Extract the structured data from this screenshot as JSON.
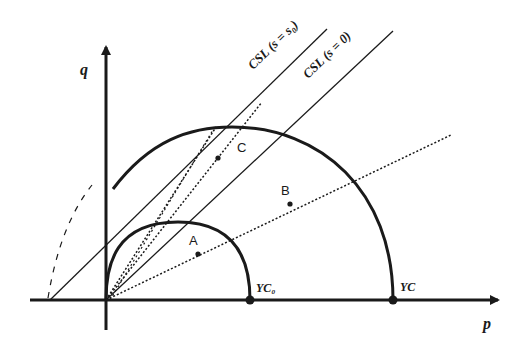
{
  "diagram": {
    "type": "stress-path / critical state diagram",
    "axes": {
      "x_label": "p",
      "y_label": "q"
    },
    "lines": [
      {
        "id": "csl-s0",
        "label": "CSL (s = s₀)"
      },
      {
        "id": "csl-0",
        "label": "CSL (s = 0)"
      }
    ],
    "yield_curves": [
      {
        "id": "yc0",
        "label": "YC₀"
      },
      {
        "id": "yc",
        "label": "YC"
      }
    ],
    "points": [
      {
        "id": "A",
        "label": "A"
      },
      {
        "id": "B",
        "label": "B"
      },
      {
        "id": "C",
        "label": "C"
      }
    ],
    "colors": {
      "stroke": "#1a1a1a",
      "background": "#ffffff"
    }
  }
}
